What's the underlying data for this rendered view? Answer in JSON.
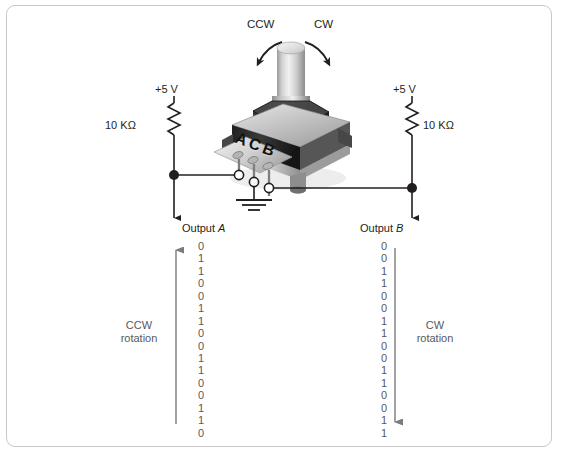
{
  "figure": {
    "background_color": "#ffffff",
    "frame_color": "#c9c9c9",
    "ink_color": "#231f20",
    "digit_color": "#58595b"
  },
  "rotation_arrows": {
    "ccw_label": "CCW",
    "cw_label": "CW"
  },
  "encoder": {
    "body_label": "ACB",
    "terminal_labels": [
      "A",
      "C",
      "B"
    ]
  },
  "left_branch": {
    "supply_label": "+5 V",
    "resistor_label": "10 KΩ",
    "output_label_prefix": "Output ",
    "output_label_name": "A",
    "rotation_line1": "CCW",
    "rotation_line2": "rotation"
  },
  "right_branch": {
    "supply_label": "+5 V",
    "resistor_label": "10 KΩ",
    "output_label_prefix": "Output ",
    "output_label_name": "B",
    "rotation_line1": "CW",
    "rotation_line2": "rotation"
  },
  "ground": {
    "symbol_name": "earth-ground"
  },
  "chart_data": {
    "type": "table",
    "series": [
      {
        "name": "Output A",
        "direction": "CCW rotation",
        "arrow_direction": "up",
        "values": [
          0,
          1,
          1,
          0,
          0,
          1,
          1,
          0,
          0,
          1,
          1,
          0,
          0,
          1,
          1,
          0
        ]
      },
      {
        "name": "Output B",
        "direction": "CW rotation",
        "arrow_direction": "down",
        "values": [
          0,
          0,
          1,
          1,
          0,
          0,
          1,
          1,
          0,
          0,
          1,
          1,
          0,
          0,
          1,
          1
        ]
      }
    ]
  }
}
